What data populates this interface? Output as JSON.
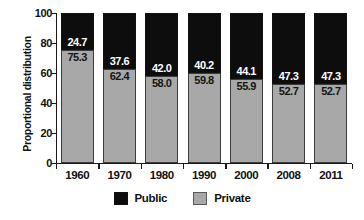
{
  "chart_data": {
    "type": "bar",
    "subtype": "stacked-100-percent",
    "title": "",
    "xlabel": "",
    "ylabel": "Proportional distribution",
    "ylim": [
      0,
      100
    ],
    "yticks": [
      "0",
      "20",
      "40",
      "60",
      "80",
      "100"
    ],
    "grid": false,
    "legend_position": "bottom-center",
    "categories": [
      "1960",
      "1970",
      "1980",
      "1990",
      "2000",
      "2008",
      "2011"
    ],
    "series": [
      {
        "name": "Public",
        "color": "#0d0d0d",
        "label_color": "#ffffff",
        "values": [
          24.7,
          37.6,
          42.0,
          40.2,
          44.1,
          47.3,
          47.3
        ],
        "value_labels": [
          "24.7",
          "37.6",
          "42.0",
          "40.2",
          "44.1",
          "47.3",
          "47.3"
        ]
      },
      {
        "name": "Private",
        "color": "#a8a8a8",
        "label_color": "#151515",
        "values": [
          75.3,
          62.4,
          58.0,
          59.8,
          55.9,
          52.7,
          52.7
        ],
        "value_labels": [
          "75.3",
          "62.4",
          "58.0",
          "59.8",
          "55.9",
          "52.7",
          "52.7"
        ]
      }
    ]
  },
  "axes": {
    "y_title": "Proportional distribution",
    "y_tick_labels": [
      "100",
      "80",
      "60",
      "40",
      "20",
      "0"
    ],
    "x_tick_labels": [
      "1960",
      "1970",
      "1980",
      "1990",
      "2000",
      "2008",
      "2011"
    ]
  },
  "legend": {
    "items": [
      {
        "label": "Public",
        "swatch": "black-square-swatch"
      },
      {
        "label": "Private",
        "swatch": "gray-square-swatch"
      }
    ]
  }
}
